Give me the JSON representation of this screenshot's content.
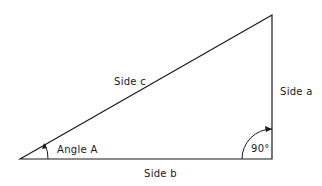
{
  "diagram": {
    "type": "right-triangle",
    "labels": {
      "side_a": "Side a",
      "side_b": "Side b",
      "side_c": "Side c",
      "angle_a": "Angle A",
      "right_angle": "90°"
    },
    "line_color": "#1a1a1a"
  }
}
